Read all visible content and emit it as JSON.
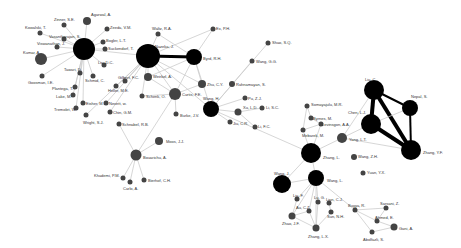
{
  "diagram": {
    "type": "co-authorship-network",
    "node_color": "#000000",
    "small_node_color": "#444444",
    "edge_color": "#cccccc",
    "strong_edge_color": "#000000",
    "nodes": [
      {
        "id": "agarwal",
        "label": "Agarwal, A.",
        "x": 87,
        "y": 21,
        "r": 4,
        "lx": 91,
        "ly": 13
      },
      {
        "id": "zinner",
        "label": "Zinner, S.E.",
        "x": 64,
        "y": 25,
        "r": 2.5,
        "lx": 54,
        "ly": 18
      },
      {
        "id": "kowalski",
        "label": "Kowalski, T.",
        "x": 40,
        "y": 33,
        "r": 2.5,
        "lx": 25,
        "ly": 26
      },
      {
        "id": "zeeda",
        "label": "Zeeda, V.M.",
        "x": 107,
        "y": 29,
        "r": 2.5,
        "lx": 110,
        "ly": 26
      },
      {
        "id": "vasantharajan",
        "label": "Vasantharajan, S.",
        "x": 64,
        "y": 39,
        "r": 2.5,
        "lx": 49,
        "ly": 35
      },
      {
        "id": "viswanathan",
        "label": "Viswanathan, J.",
        "x": 57,
        "y": 47,
        "r": 2.5,
        "lx": 37,
        "ly": 42
      },
      {
        "id": "bogler",
        "label": "Bogler, L.T.",
        "x": 103,
        "y": 42,
        "r": 2.5,
        "lx": 106,
        "ly": 39
      },
      {
        "id": "hub1",
        "label": "",
        "x": 84,
        "y": 49,
        "r": 11
      },
      {
        "id": "suckendorf",
        "label": "Suckendorf, T.",
        "x": 105,
        "y": 49,
        "r": 2.5,
        "lx": 108,
        "ly": 47
      },
      {
        "id": "kumar",
        "label": "Kumar, A.",
        "x": 41,
        "y": 59,
        "r": 6,
        "lx": 23,
        "ly": 51
      },
      {
        "id": "liu_dc",
        "label": "Liu, D.C.",
        "x": 104,
        "y": 65,
        "r": 2.5,
        "lx": 98,
        "ly": 61
      },
      {
        "id": "tawari",
        "label": "Tawari, D.",
        "x": 80,
        "y": 73,
        "r": 2.5,
        "lx": 64,
        "ly": 68
      },
      {
        "id": "schmid_c",
        "label": "Schmid, C.",
        "x": 93,
        "y": 76,
        "r": 2.5,
        "lx": 85,
        "ly": 79
      },
      {
        "id": "goosman",
        "label": "Goosman, I.E.",
        "x": 42,
        "y": 76,
        "r": 2.5,
        "lx": 28,
        "ly": 81
      },
      {
        "id": "plantega",
        "label": "Plantega, T.",
        "x": 75,
        "y": 87,
        "r": 2.5,
        "lx": 52,
        "ly": 87
      },
      {
        "id": "gilbert",
        "label": "Gilbert, F.C.",
        "x": 125,
        "y": 81,
        "r": 2.5,
        "lx": 118,
        "ly": 76
      },
      {
        "id": "heller",
        "label": "Heller, M.E.",
        "x": 116,
        "y": 86,
        "r": 2.5,
        "lx": 108,
        "ly": 89
      },
      {
        "id": "lake",
        "label": "Lake, M.",
        "x": 73,
        "y": 95,
        "r": 2.5,
        "lx": 56,
        "ly": 95
      },
      {
        "id": "walz",
        "label": "Waltz, R.A.",
        "x": 158,
        "y": 34,
        "r": 2.5,
        "lx": 152,
        "ly": 27
      },
      {
        "id": "ex_ph",
        "label": "Ex, P.H.",
        "x": 213,
        "y": 29,
        "r": 2.5,
        "lx": 216,
        "ly": 27
      },
      {
        "id": "nazeka",
        "label": "Nazeka, J.",
        "x": 148,
        "y": 56,
        "r": 12,
        "lx": 155,
        "ly": 45
      },
      {
        "id": "byrd",
        "label": "Byrd, R.H.",
        "x": 194,
        "y": 57,
        "r": 8,
        "lx": 203,
        "ly": 57
      },
      {
        "id": "shao",
        "label": "Shao, S.Q.",
        "x": 268,
        "y": 43,
        "r": 2.5,
        "lx": 272,
        "ly": 41
      },
      {
        "id": "wang_gg",
        "label": "Wang, G.G.",
        "x": 252,
        "y": 61,
        "r": 2.5,
        "lx": 256,
        "ly": 60
      },
      {
        "id": "weirkel",
        "label": "Weirkel, A.",
        "x": 148,
        "y": 77,
        "r": 4,
        "lx": 153,
        "ly": 75
      },
      {
        "id": "zhu_cy",
        "label": "Zhu, C.Y.",
        "x": 202,
        "y": 84,
        "r": 4,
        "lx": 207,
        "ly": 83
      },
      {
        "id": "rahnamayan",
        "label": "Rahnamayan, S.",
        "x": 232,
        "y": 84,
        "r": 3,
        "lx": 236,
        "ly": 83
      },
      {
        "id": "curtis",
        "label": "Curtis, F.E.",
        "x": 175,
        "y": 94,
        "r": 6,
        "lx": 182,
        "ly": 93
      },
      {
        "id": "schenk",
        "label": "Schenk, O.",
        "x": 142,
        "y": 96,
        "r": 2.5,
        "lx": 146,
        "ly": 95
      },
      {
        "id": "eisher",
        "label": "Eisher, M.",
        "x": 83,
        "y": 103,
        "r": 2.5,
        "lx": 86,
        "ly": 102
      },
      {
        "id": "nevett",
        "label": "Nevett, w.",
        "x": 106,
        "y": 103,
        "r": 2.5,
        "lx": 109,
        "ly": 102
      },
      {
        "id": "tremolet",
        "label": "Tremolet, W.",
        "x": 76,
        "y": 108,
        "r": 2.5,
        "lx": 54,
        "ly": 108
      },
      {
        "id": "chin",
        "label": "Chin, G.M.",
        "x": 110,
        "y": 112,
        "r": 2.5,
        "lx": 113,
        "ly": 111
      },
      {
        "id": "wright",
        "label": "Wright, S.J.",
        "x": 86,
        "y": 115,
        "r": 2.5,
        "lx": 83,
        "ly": 121
      },
      {
        "id": "schnabel",
        "label": "Schnabel, R.B.",
        "x": 119,
        "y": 124,
        "r": 2.5,
        "lx": 122,
        "ly": 123
      },
      {
        "id": "burke",
        "label": "Burke, J.V.",
        "x": 176,
        "y": 114,
        "r": 2.5,
        "lx": 180,
        "ly": 114
      },
      {
        "id": "wang_h",
        "label": "Wang, H.",
        "x": 211,
        "y": 109,
        "r": 8,
        "lx": 203,
        "ly": 97
      },
      {
        "id": "pu_zj",
        "label": "Pu, Z.J.",
        "x": 245,
        "y": 98,
        "r": 2.5,
        "lx": 248,
        "ly": 97
      },
      {
        "id": "xu_ld",
        "label": "Xu, L.D.",
        "x": 238,
        "y": 112,
        "r": 3.5,
        "lx": 243,
        "ly": 106
      },
      {
        "id": "li_sc",
        "label": "Li, S.C.",
        "x": 262,
        "y": 108,
        "r": 2.5,
        "lx": 266,
        "ly": 106
      },
      {
        "id": "jiu_cr",
        "label": "Jiu, C.R.",
        "x": 230,
        "y": 122,
        "r": 2.5,
        "lx": 233,
        "ly": 122
      },
      {
        "id": "li_fc",
        "label": "Li, F.C.",
        "x": 255,
        "y": 127,
        "r": 2.5,
        "lx": 258,
        "ly": 125
      },
      {
        "id": "moos",
        "label": "Moos, J.J.",
        "x": 159,
        "y": 141,
        "r": 4,
        "lx": 166,
        "ly": 140
      },
      {
        "id": "bouarichu",
        "label": "Bouarichu, A.",
        "x": 136,
        "y": 155,
        "r": 5.5,
        "lx": 143,
        "ly": 156
      },
      {
        "id": "khademi",
        "label": "Khademi, P.M.",
        "x": 123,
        "y": 178,
        "r": 2.5,
        "lx": 94,
        "ly": 174
      },
      {
        "id": "carlo",
        "label": "Carlo, A.",
        "x": 130,
        "y": 182,
        "r": 2.5,
        "lx": 123,
        "ly": 187
      },
      {
        "id": "bierhof",
        "label": "Bierhof, C.H.",
        "x": 144,
        "y": 180,
        "r": 2.5,
        "lx": 148,
        "ly": 179
      },
      {
        "id": "liu_c",
        "label": "Liu, C.",
        "x": 374,
        "y": 90,
        "r": 10,
        "lx": 365,
        "ly": 78
      },
      {
        "id": "nepal",
        "label": "Nepal, S.",
        "x": 410,
        "y": 108,
        "r": 8,
        "lx": 411,
        "ly": 95
      },
      {
        "id": "chen_lj",
        "label": "Chen, L.J.",
        "x": 371,
        "y": 124,
        "r": 10,
        "lx": 348,
        "ly": 111
      },
      {
        "id": "somayajulu",
        "label": "Somayajulu, M.R.",
        "x": 307,
        "y": 106,
        "r": 2.5,
        "lx": 311,
        "ly": 103
      },
      {
        "id": "byrnes",
        "label": "Byrnes, M.",
        "x": 311,
        "y": 118,
        "r": 2.5,
        "lx": 313,
        "ly": 117
      },
      {
        "id": "levinsgon",
        "label": "Levinsgon, A.A.",
        "x": 321,
        "y": 124,
        "r": 2.5,
        "lx": 322,
        "ly": 123
      },
      {
        "id": "mebarek",
        "label": "Mebarek, M.",
        "x": 303,
        "y": 130,
        "r": 2.5,
        "lx": 302,
        "ly": 134
      },
      {
        "id": "yang_lt",
        "label": "Yang, L.T.",
        "x": 342,
        "y": 138,
        "r": 5,
        "lx": 349,
        "ly": 138
      },
      {
        "id": "zhang_yf",
        "label": "Zhang, Y.F.",
        "x": 411,
        "y": 150,
        "r": 10,
        "lx": 423,
        "ly": 151
      },
      {
        "id": "zhang_l",
        "label": "Zhang, L.",
        "x": 311,
        "y": 153,
        "r": 10,
        "lx": 323,
        "ly": 156
      },
      {
        "id": "wang_zh",
        "label": "Wang, Z.H.",
        "x": 354,
        "y": 157,
        "r": 3,
        "lx": 358,
        "ly": 155
      },
      {
        "id": "yuan",
        "label": "Yuan, Y.X.",
        "x": 363,
        "y": 173,
        "r": 2.5,
        "lx": 367,
        "ly": 171
      },
      {
        "id": "wang_j",
        "label": "Wang, J.",
        "x": 282,
        "y": 184,
        "r": 9,
        "lx": 274,
        "ly": 172
      },
      {
        "id": "wang_l",
        "label": "Wang, L.",
        "x": 316,
        "y": 178,
        "r": 8,
        "lx": 327,
        "ly": 179
      },
      {
        "id": "liu_f",
        "label": "Liu, F.",
        "x": 297,
        "y": 199,
        "r": 2.5,
        "lx": 293,
        "ly": 194
      },
      {
        "id": "lu_g",
        "label": "Lu, G.",
        "x": 318,
        "y": 202,
        "r": 2.5,
        "lx": 314,
        "ly": 196
      },
      {
        "id": "lian_cj",
        "label": "Lian, C.J.",
        "x": 329,
        "y": 203,
        "r": 2.5,
        "lx": 326,
        "ly": 198
      },
      {
        "id": "au_cz",
        "label": "Au, C.Z.",
        "x": 309,
        "y": 211,
        "r": 2.5,
        "lx": 296,
        "ly": 206
      },
      {
        "id": "sun_nh",
        "label": "Sun, N.H.",
        "x": 331,
        "y": 212,
        "r": 2.5,
        "lx": 327,
        "ly": 215
      },
      {
        "id": "zhao_jf",
        "label": "Zhao, J.F.",
        "x": 292,
        "y": 216,
        "r": 3.5,
        "lx": 282,
        "ly": 222
      },
      {
        "id": "zhang_lx",
        "label": "Zhang, L.X.",
        "x": 316,
        "y": 228,
        "r": 3.5,
        "lx": 308,
        "ly": 235
      },
      {
        "id": "buyya",
        "label": "Buyya, R.",
        "x": 355,
        "y": 210,
        "r": 2.5,
        "lx": 348,
        "ly": 204
      },
      {
        "id": "sarsani",
        "label": "Sarsani, Z.",
        "x": 386,
        "y": 208,
        "r": 2.5,
        "lx": 380,
        "ly": 202
      },
      {
        "id": "ahmed",
        "label": "Ahmed, E.",
        "x": 377,
        "y": 221,
        "r": 2.5,
        "lx": 375,
        "ly": 216
      },
      {
        "id": "gani",
        "label": "Gani, A.",
        "x": 394,
        "y": 227,
        "r": 3.5,
        "lx": 399,
        "ly": 227
      },
      {
        "id": "abolfazli",
        "label": "Abolfazli, S.",
        "x": 372,
        "y": 232,
        "r": 2.5,
        "lx": 363,
        "ly": 238
      }
    ],
    "edges": [
      [
        "hub1",
        "agarwal",
        1
      ],
      [
        "hub1",
        "zinner",
        1
      ],
      [
        "hub1",
        "kowalski",
        1
      ],
      [
        "hub1",
        "zeeda",
        1
      ],
      [
        "hub1",
        "vasantharajan",
        1
      ],
      [
        "hub1",
        "viswanathan",
        1
      ],
      [
        "hub1",
        "bogler",
        1
      ],
      [
        "hub1",
        "suckendorf",
        1
      ],
      [
        "hub1",
        "kumar",
        1
      ],
      [
        "hub1",
        "liu_dc",
        1
      ],
      [
        "hub1",
        "tawari",
        1
      ],
      [
        "hub1",
        "schmid_c",
        1
      ],
      [
        "hub1",
        "goosman",
        1
      ],
      [
        "hub1",
        "nazeka",
        1.5
      ],
      [
        "hub1",
        "plantega",
        1
      ],
      [
        "hub1",
        "lake",
        1
      ],
      [
        "hub1",
        "eisher",
        1
      ],
      [
        "hub1",
        "tremolet",
        1
      ],
      [
        "nazeka",
        "byrd",
        3
      ],
      [
        "nazeka",
        "walz",
        1
      ],
      [
        "nazeka",
        "ex_ph",
        1
      ],
      [
        "nazeka",
        "weirkel",
        1.5
      ],
      [
        "nazeka",
        "curtis",
        1.5
      ],
      [
        "nazeka",
        "gilbert",
        1
      ],
      [
        "nazeka",
        "heller",
        1
      ],
      [
        "nazeka",
        "schenk",
        1
      ],
      [
        "nazeka",
        "zhu_cy",
        1
      ],
      [
        "nazeka",
        "wang_h",
        1
      ],
      [
        "nazeka",
        "nevett",
        1
      ],
      [
        "nazeka",
        "chin",
        1
      ],
      [
        "nazeka",
        "wright",
        1
      ],
      [
        "byrd",
        "ex_ph",
        1
      ],
      [
        "byrd",
        "zhu_cy",
        1.5
      ],
      [
        "byrd",
        "curtis",
        1.5
      ],
      [
        "byrd",
        "weirkel",
        1
      ],
      [
        "byrd",
        "walz",
        1
      ],
      [
        "byrd",
        "wang_h",
        1
      ],
      [
        "weirkel",
        "curtis",
        1.5
      ],
      [
        "curtis",
        "zhu_cy",
        1
      ],
      [
        "curtis",
        "burke",
        1
      ],
      [
        "curtis",
        "schenk",
        1
      ],
      [
        "curtis",
        "bouarichu",
        1
      ],
      [
        "wang_h",
        "pu_zj",
        1
      ],
      [
        "wang_h",
        "xu_ld",
        1
      ],
      [
        "wang_h",
        "jiu_cr",
        1
      ],
      [
        "wang_h",
        "shao",
        1
      ],
      [
        "wang_h",
        "wang_gg",
        1
      ],
      [
        "wang_h",
        "zhang_l",
        1
      ],
      [
        "xu_ld",
        "li_sc",
        1
      ],
      [
        "xu_ld",
        "li_fc",
        1
      ],
      [
        "moos",
        "bouarichu",
        1
      ],
      [
        "bouarichu",
        "khademi",
        1
      ],
      [
        "bouarichu",
        "carlo",
        1
      ],
      [
        "bouarichu",
        "bierhof",
        1
      ],
      [
        "bouarichu",
        "schnabel",
        1
      ],
      [
        "liu_c",
        "chen_lj",
        4
      ],
      [
        "liu_c",
        "zhang_yf",
        4
      ],
      [
        "liu_c",
        "nepal",
        2
      ],
      [
        "chen_lj",
        "zhang_yf",
        4
      ],
      [
        "chen_lj",
        "nepal",
        1.5
      ],
      [
        "nepal",
        "zhang_yf",
        2
      ],
      [
        "liu_c",
        "yang_lt",
        1
      ],
      [
        "chen_lj",
        "yang_lt",
        1
      ],
      [
        "yang_lt",
        "zhang_yf",
        1
      ],
      [
        "yang_lt",
        "zhang_l",
        1
      ],
      [
        "somayajulu",
        "byrnes",
        1
      ],
      [
        "byrnes",
        "levinsgon",
        1
      ],
      [
        "levinsgon",
        "mebarek",
        1
      ],
      [
        "mebarek",
        "somayajulu",
        1
      ],
      [
        "zhang_l",
        "levinsgon",
        1
      ],
      [
        "zhang_l",
        "mebarek",
        1
      ],
      [
        "zhang_l",
        "wang_l",
        1
      ],
      [
        "zhang_l",
        "wang_j",
        1
      ],
      [
        "wang_l",
        "wang_j",
        1
      ],
      [
        "wang_l",
        "lu_g",
        1
      ],
      [
        "wang_l",
        "au_cz",
        1
      ],
      [
        "wang_l",
        "zhao_jf",
        1
      ],
      [
        "wang_l",
        "zhang_lx",
        1
      ],
      [
        "wang_l",
        "liu_f",
        1
      ],
      [
        "wang_l",
        "buyya",
        1
      ],
      [
        "zhao_jf",
        "zhang_lx",
        1
      ],
      [
        "zhao_jf",
        "au_cz",
        1
      ],
      [
        "zhao_jf",
        "liu_f",
        1
      ],
      [
        "zhang_lx",
        "au_cz",
        1
      ],
      [
        "zhang_lx",
        "lu_g",
        1
      ],
      [
        "zhang_lx",
        "sun_nh",
        1
      ],
      [
        "lian_cj",
        "sun_nh",
        1
      ],
      [
        "buyya",
        "ahmed",
        1
      ],
      [
        "buyya",
        "abolfazli",
        1
      ],
      [
        "buyya",
        "sarsani",
        1
      ],
      [
        "ahmed",
        "gani",
        1
      ],
      [
        "abolfazli",
        "gani",
        1
      ],
      [
        "sarsani",
        "ahmed",
        1
      ]
    ]
  }
}
